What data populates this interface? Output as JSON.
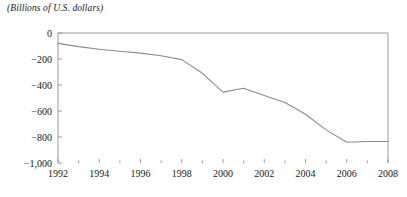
{
  "chart_data": {
    "type": "line",
    "title": "(Billions of U.S. dollars)",
    "xlabel": "",
    "ylabel": "",
    "ylim": [
      -1000,
      0
    ],
    "xlim": [
      1992,
      2008
    ],
    "grid": false,
    "legend": null,
    "line_color": "#8c8c8c",
    "axis_color": "#9a9a9a",
    "text_color": "#1a1a1a",
    "background": "#ffffff",
    "x": [
      1992,
      1993,
      1994,
      1995,
      1996,
      1997,
      1998,
      1999,
      2000,
      2001,
      2002,
      2003,
      2004,
      2005,
      2006,
      2007,
      2008
    ],
    "values": [
      -80,
      -105,
      -125,
      -140,
      -155,
      -175,
      -205,
      -310,
      -455,
      -425,
      -480,
      -535,
      -625,
      -745,
      -840,
      -835,
      -835
    ],
    "series": [
      {
        "name": "Current account balance",
        "values": [
          -80,
          -105,
          -125,
          -140,
          -155,
          -175,
          -205,
          -310,
          -455,
          -425,
          -480,
          -535,
          -625,
          -745,
          -840,
          -835,
          -835
        ]
      }
    ],
    "y_ticks": [
      0,
      -200,
      -400,
      -600,
      -800,
      -1000
    ],
    "y_tick_labels": [
      "0",
      "−200",
      "−400",
      "−600",
      "−800",
      "−1,000"
    ],
    "x_ticks": [
      1992,
      1994,
      1996,
      1998,
      2000,
      2002,
      2004,
      2006,
      2008
    ],
    "x_tick_labels": [
      "1992",
      "1994",
      "1996",
      "1998",
      "2000",
      "2002",
      "2004",
      "2006",
      "2008"
    ],
    "x_minor_ticks": [
      1993,
      1995,
      1997,
      1999,
      2001,
      2003,
      2005,
      2007
    ]
  }
}
